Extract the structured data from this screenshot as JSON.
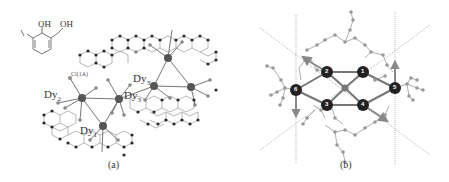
{
  "figure": {
    "panel_a": {
      "caption": "(a)",
      "ligand_labels": {
        "oh1": "OH",
        "oh2": "OH"
      },
      "atom_labels": {
        "cl": "Cl(1A)",
        "dy1": "Dy",
        "dy1_sub": "1",
        "dy2": "Dy",
        "dy2_sub": "2",
        "dy3": "Dy",
        "dy3_sub": "3",
        "dy4": "Dy",
        "dy4_sub": "3'"
      }
    },
    "panel_b": {
      "caption": "(b)",
      "atom_numbers": [
        "1",
        "2",
        "3",
        "4",
        "5",
        "6"
      ]
    }
  },
  "colors": {
    "atom_dark": "#2a2a2a",
    "atom_mid": "#777777",
    "bond": "#888888",
    "dy_atom": "#555555",
    "axis_line": "#aaaaaa"
  }
}
